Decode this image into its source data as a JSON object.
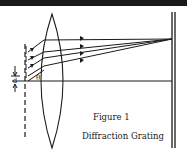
{
  "figure": {
    "number_label": "Figure 1",
    "title": "Diffraction Grating",
    "labels": {
      "spacing": "d",
      "angle": "θ"
    }
  },
  "colors": {
    "ink": "#1a1a1a",
    "background": "#ffffff"
  }
}
